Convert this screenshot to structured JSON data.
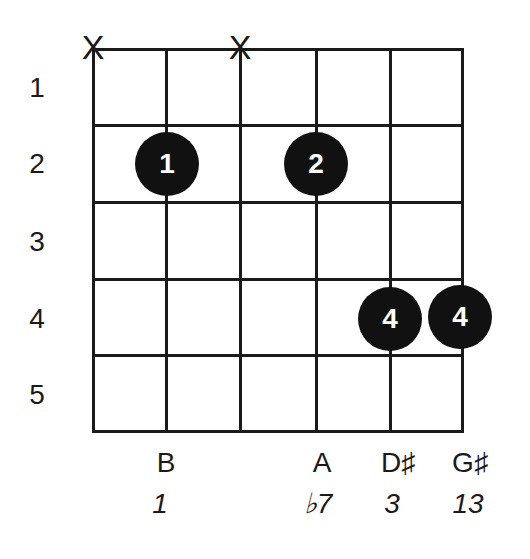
{
  "diagram": {
    "type": "guitar-chord-diagram",
    "fret_numbers": [
      "1",
      "2",
      "3",
      "4",
      "5"
    ],
    "strings": 6,
    "frets": 5,
    "mute_symbol": "X",
    "muted_strings": [
      1,
      3
    ],
    "fingers": [
      {
        "string": 2,
        "fret": 2,
        "label": "1"
      },
      {
        "string": 4,
        "fret": 2,
        "label": "2"
      },
      {
        "string": 5,
        "fret": 4,
        "label": "4"
      },
      {
        "string": 6,
        "fret": 4,
        "label": "4"
      }
    ],
    "notes": [
      {
        "string": 2,
        "note": "B",
        "interval": "1"
      },
      {
        "string": 4,
        "note": "A",
        "interval": "♭7"
      },
      {
        "string": 5,
        "note": "D♯",
        "interval": "3"
      },
      {
        "string": 6,
        "note": "G♯",
        "interval": "13"
      }
    ],
    "colors": {
      "line": "#1a1a1a",
      "dot": "#111111",
      "dot_text": "#ffffff"
    }
  }
}
